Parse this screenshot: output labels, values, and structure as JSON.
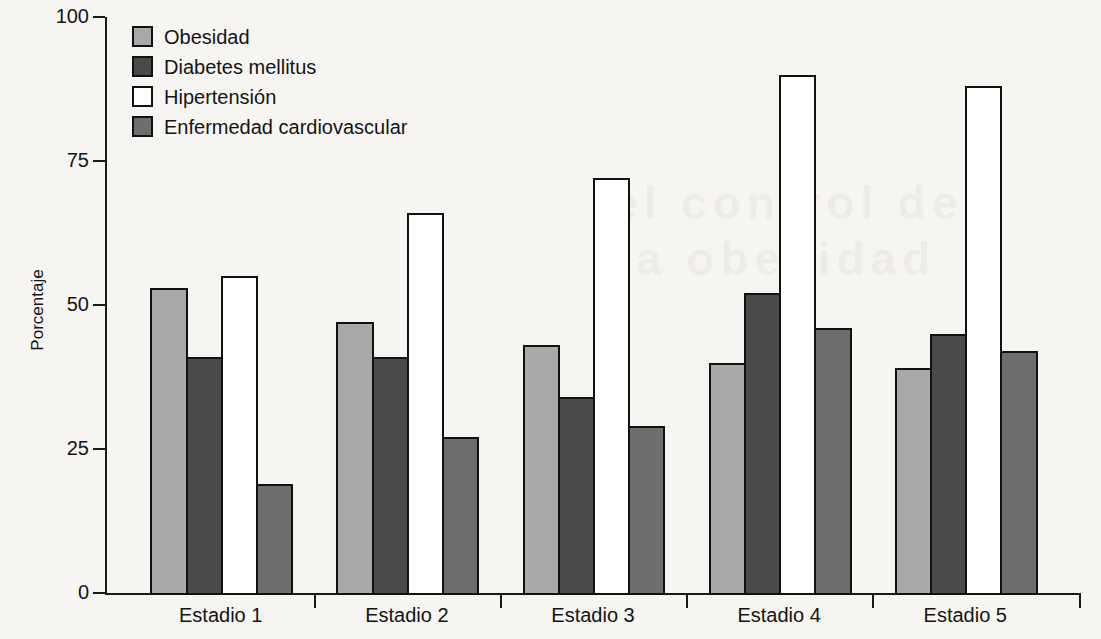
{
  "chart_data": {
    "type": "bar",
    "title": "",
    "xlabel": "",
    "ylabel": "Porcentaje",
    "ylim": [
      0,
      100
    ],
    "yticks": [
      0,
      25,
      50,
      75,
      100
    ],
    "ytick_labels": [
      "0",
      "25",
      "50",
      "75",
      "100"
    ],
    "grid": false,
    "legend_position": "top-left",
    "categories": [
      "Estadio 1",
      "Estadio 2",
      "Estadio 3",
      "Estadio 4",
      "Estadio 5"
    ],
    "series": [
      {
        "name": "Obesidad",
        "color": "#a9a9a9",
        "values": [
          53,
          47,
          43,
          40,
          39
        ]
      },
      {
        "name": "Diabetes mellitus",
        "color": "#4a4a4a",
        "values": [
          41,
          41,
          34,
          52,
          45
        ]
      },
      {
        "name": "Hipertensión",
        "color": "#ffffff",
        "values": [
          55,
          66,
          72,
          90,
          88
        ]
      },
      {
        "name": "Enfermedad cardiovascular",
        "color": "#6d6d6d",
        "values": [
          19,
          27,
          29,
          46,
          42
        ]
      }
    ]
  },
  "legend": {
    "items": [
      {
        "label": "Obesidad"
      },
      {
        "label": "Diabetes mellitus"
      },
      {
        "label": "Hipertensión"
      },
      {
        "label": "Enfermedad cardiovascular"
      }
    ]
  },
  "background_bleed": {
    "line1": "el control de",
    "line2": "a obesidad"
  }
}
